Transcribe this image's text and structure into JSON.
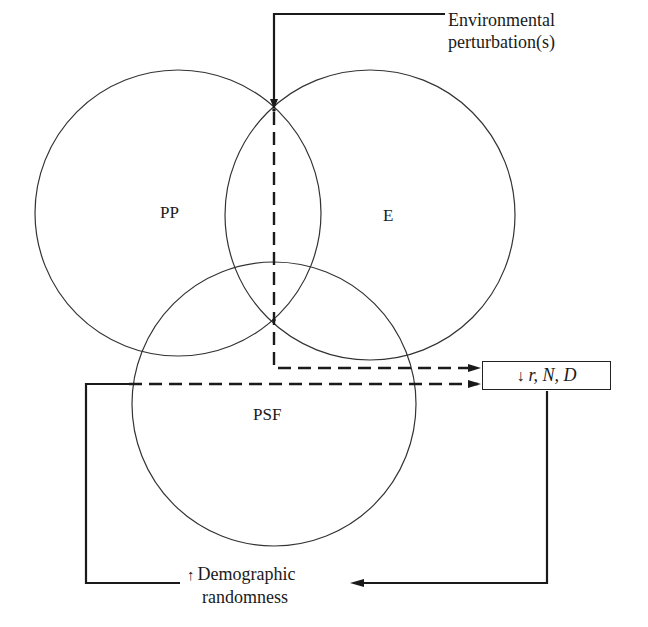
{
  "diagram": {
    "type": "venn-feedback",
    "circles": [
      {
        "id": "PP",
        "label": "PP",
        "cx": 178,
        "cy": 213,
        "r": 143
      },
      {
        "id": "E",
        "label": "E",
        "cx": 370,
        "cy": 215,
        "r": 145
      },
      {
        "id": "PSF",
        "label": "PSF",
        "cx": 274,
        "cy": 404,
        "r": 142
      }
    ],
    "labels": {
      "pp": "PP",
      "e": "E",
      "psf": "PSF",
      "environmental_line1": "Environmental",
      "environmental_line2": "perturbation(s)",
      "outcome_arrow": "↓",
      "outcome": "r, N, D",
      "demographic_arrow": "↑",
      "demographic_line1": "Demographic",
      "demographic_line2": "randomness"
    },
    "colors": {
      "line": "#1a1a1a",
      "circle": "#333333",
      "background": "#ffffff"
    }
  }
}
